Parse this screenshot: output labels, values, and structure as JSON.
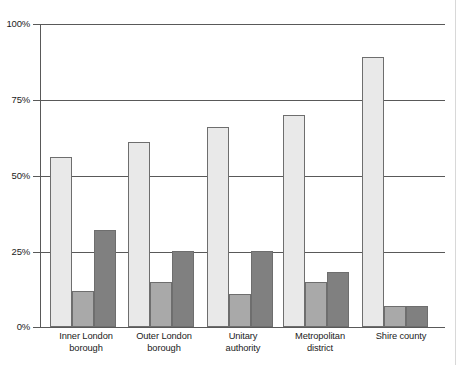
{
  "chart_data": {
    "type": "bar",
    "title": "",
    "subtitle": "",
    "xlabel": "",
    "ylabel": "",
    "ylim": [
      0,
      100
    ],
    "y_ticks": [
      "0%",
      "25%",
      "50%",
      "75%",
      "100%"
    ],
    "y_tick_values": [
      0,
      25,
      50,
      75,
      100
    ],
    "grid": "horizontal",
    "legend_position": "none",
    "categories": [
      "Inner London borough",
      "Outer London borough",
      "Unitary authority",
      "Metropolitan district",
      "Shire county"
    ],
    "category_lines": [
      [
        "Inner London",
        "borough"
      ],
      [
        "Outer London",
        "borough"
      ],
      [
        "Unitary",
        "authority"
      ],
      [
        "Metropolitan",
        "district"
      ],
      [
        "Shire county",
        ""
      ]
    ],
    "series": [
      {
        "name": "series-1",
        "color": "#e9e9e9",
        "values": [
          56,
          61,
          66,
          70,
          89
        ]
      },
      {
        "name": "series-2",
        "color": "#a9a9a9",
        "values": [
          12,
          15,
          11,
          15,
          7
        ]
      },
      {
        "name": "series-3",
        "color": "#808080",
        "values": [
          32,
          25,
          25,
          18,
          7
        ]
      }
    ]
  },
  "axis": {
    "tick_100": "100%",
    "tick_75": "75%",
    "tick_50": "50%",
    "tick_25": "25%",
    "tick_0": "0%"
  },
  "labels": {
    "cat0_line1": "Inner London",
    "cat0_line2": "borough",
    "cat1_line1": "Outer London",
    "cat1_line2": "borough",
    "cat2_line1": "Unitary",
    "cat2_line2": "authority",
    "cat3_line1": "Metropolitan",
    "cat3_line2": "district",
    "cat4_line1": "Shire county",
    "cat4_line2": ""
  },
  "colors": {
    "series1": "#e9e9e9",
    "series2": "#a9a9a9",
    "series3": "#808080",
    "axis": "#595959",
    "bar_border": "#6e6e6e",
    "text": "#1b1b1b"
  }
}
